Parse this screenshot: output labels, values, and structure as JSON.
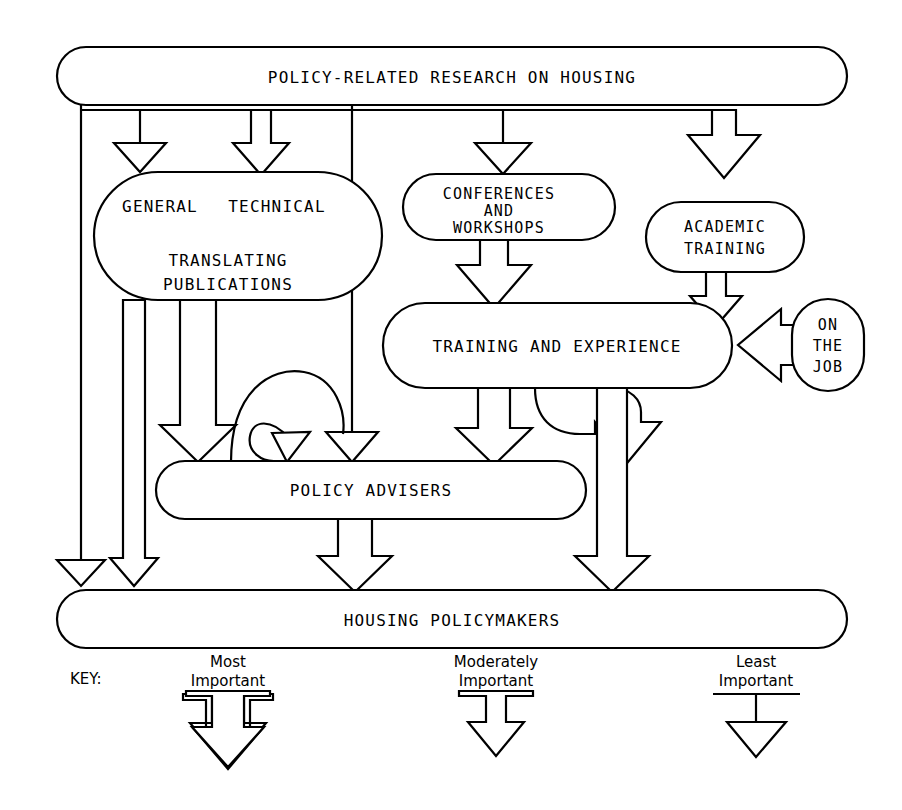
{
  "diagram": {
    "ink_color": "#000000",
    "background_color": "#ffffff",
    "nodes": [
      {
        "id": "research",
        "label": "POLICY-RELATED RESEARCH ON HOUSING"
      },
      {
        "id": "general",
        "label": "GENERAL"
      },
      {
        "id": "technical",
        "label": "TECHNICAL"
      },
      {
        "id": "translating",
        "label_line1": "TRANSLATING",
        "label_line2": "PUBLICATIONS"
      },
      {
        "id": "conferences",
        "label_line1": "CONFERENCES",
        "label_line2": "AND",
        "label_line3": "WORKSHOPS"
      },
      {
        "id": "academic",
        "label_line1": "ACADEMIC",
        "label_line2": "TRAINING"
      },
      {
        "id": "training",
        "label": "TRAINING AND EXPERIENCE"
      },
      {
        "id": "onthejob",
        "label_line1": "ON",
        "label_line2": "THE",
        "label_line3": "JOB"
      },
      {
        "id": "advisers",
        "label": "POLICY ADVISERS"
      },
      {
        "id": "policymakers",
        "label": "HOUSING POLICYMAKERS"
      }
    ],
    "key": {
      "title": "KEY:",
      "entries": [
        {
          "id": "most",
          "line1": "Most",
          "line2": "Important",
          "weight": "most"
        },
        {
          "id": "moderately",
          "line1": "Moderately",
          "line2": "Important",
          "weight": "moderate"
        },
        {
          "id": "least",
          "line1": "Least",
          "line2": "Important",
          "weight": "least"
        }
      ]
    },
    "edges": [
      {
        "from": "research",
        "to": "general",
        "weight": "least"
      },
      {
        "from": "research",
        "to": "technical",
        "weight": "moderate"
      },
      {
        "from": "research",
        "to": "conferences",
        "weight": "least"
      },
      {
        "from": "research",
        "to": "academic",
        "weight": "most"
      },
      {
        "from": "research",
        "to": "advisers",
        "weight": "least"
      },
      {
        "from": "research",
        "to": "policymakers",
        "weight": "least"
      },
      {
        "from": "translating",
        "to": "advisers",
        "weight": "most"
      },
      {
        "from": "translating",
        "to": "policymakers",
        "weight": "moderate"
      },
      {
        "from": "conferences",
        "to": "training",
        "weight": "most"
      },
      {
        "from": "academic",
        "to": "training",
        "weight": "moderate"
      },
      {
        "from": "onthejob",
        "to": "training",
        "weight": "most"
      },
      {
        "from": "training",
        "to": "advisers",
        "weight": "most"
      },
      {
        "from": "training",
        "to": "policymakers",
        "weight": "most"
      },
      {
        "from": "advisers",
        "to": "advisers",
        "weight": "least"
      },
      {
        "from": "advisers",
        "to": "policymakers",
        "weight": "most"
      }
    ]
  }
}
